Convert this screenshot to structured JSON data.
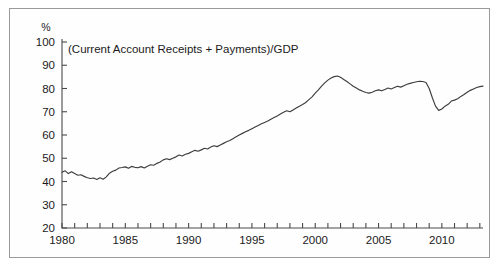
{
  "chart_data": {
    "type": "line",
    "title": "(Current Account Receipts + Payments)/GDP",
    "unit_label": "%",
    "xlabel": "",
    "ylabel": "",
    "grid": false,
    "legend": null,
    "xlim": [
      1980,
      2013.25
    ],
    "ylim": [
      20,
      100
    ],
    "ytick_values": [
      20,
      30,
      40,
      50,
      60,
      70,
      80,
      90,
      100
    ],
    "ytick_labels": [
      "20",
      "30",
      "40",
      "50",
      "60",
      "70",
      "80",
      "90",
      "100"
    ],
    "xtick_values": [
      1980,
      1981,
      1982,
      1983,
      1984,
      1985,
      1986,
      1987,
      1988,
      1989,
      1990,
      1991,
      1992,
      1993,
      1994,
      1995,
      1996,
      1997,
      1998,
      1999,
      2000,
      2001,
      2002,
      2003,
      2004,
      2005,
      2006,
      2007,
      2008,
      2009,
      2010,
      2011,
      2012,
      2013
    ],
    "xtick_labels_major": [
      "1980",
      "1985",
      "1990",
      "1995",
      "2000",
      "2005",
      "2010"
    ],
    "xtick_values_major": [
      1980,
      1985,
      1990,
      1995,
      2000,
      2005,
      2010
    ],
    "series": [
      {
        "name": "(Current Account Receipts + Payments)/GDP",
        "color": "#3d3d3d",
        "x": [
          1980.0,
          1980.25,
          1980.5,
          1980.75,
          1981.0,
          1981.25,
          1981.5,
          1981.75,
          1982.0,
          1982.25,
          1982.5,
          1982.75,
          1983.0,
          1983.25,
          1983.5,
          1983.75,
          1984.0,
          1984.25,
          1984.5,
          1984.75,
          1985.0,
          1985.25,
          1985.5,
          1985.75,
          1986.0,
          1986.25,
          1986.5,
          1986.75,
          1987.0,
          1987.25,
          1987.5,
          1987.75,
          1988.0,
          1988.25,
          1988.5,
          1988.75,
          1989.0,
          1989.25,
          1989.5,
          1989.75,
          1990.0,
          1990.25,
          1990.5,
          1990.75,
          1991.0,
          1991.25,
          1991.5,
          1991.75,
          1992.0,
          1992.25,
          1992.5,
          1992.75,
          1993.0,
          1993.25,
          1993.5,
          1993.75,
          1994.0,
          1994.25,
          1994.5,
          1994.75,
          1995.0,
          1995.25,
          1995.5,
          1995.75,
          1996.0,
          1996.25,
          1996.5,
          1996.75,
          1997.0,
          1997.25,
          1997.5,
          1997.75,
          1998.0,
          1998.25,
          1998.5,
          1998.75,
          1999.0,
          1999.25,
          1999.5,
          1999.75,
          2000.0,
          2000.25,
          2000.5,
          2000.75,
          2001.0,
          2001.25,
          2001.5,
          2001.75,
          2002.0,
          2002.25,
          2002.5,
          2002.75,
          2003.0,
          2003.25,
          2003.5,
          2003.75,
          2004.0,
          2004.25,
          2004.5,
          2004.75,
          2005.0,
          2005.25,
          2005.5,
          2005.75,
          2006.0,
          2006.25,
          2006.5,
          2006.75,
          2007.0,
          2007.25,
          2007.5,
          2007.75,
          2008.0,
          2008.25,
          2008.5,
          2008.75,
          2009.0,
          2009.25,
          2009.5,
          2009.75,
          2010.0,
          2010.25,
          2010.5,
          2010.75,
          2011.0,
          2011.25,
          2011.5,
          2011.75,
          2012.0,
          2012.25,
          2012.5,
          2012.75,
          2013.0,
          2013.25
        ],
        "y": [
          44.0,
          44.6,
          43.4,
          44.2,
          43.4,
          42.7,
          42.9,
          42.2,
          41.6,
          41.3,
          41.5,
          40.9,
          41.6,
          41.0,
          42.0,
          43.6,
          44.4,
          44.9,
          45.8,
          46.0,
          46.3,
          45.7,
          46.5,
          46.1,
          45.9,
          46.4,
          45.8,
          46.6,
          47.2,
          47.0,
          47.8,
          48.4,
          49.3,
          49.8,
          49.4,
          50.0,
          50.6,
          51.4,
          51.0,
          51.7,
          52.1,
          52.8,
          53.4,
          53.0,
          53.6,
          54.3,
          54.0,
          54.8,
          55.4,
          55.0,
          55.7,
          56.4,
          57.1,
          57.6,
          58.4,
          59.2,
          60.0,
          60.7,
          61.4,
          62.0,
          62.7,
          63.4,
          64.1,
          64.8,
          65.4,
          66.0,
          66.8,
          67.5,
          68.2,
          69.0,
          69.8,
          70.4,
          70.0,
          70.8,
          71.6,
          72.4,
          73.1,
          74.0,
          75.2,
          76.4,
          78.0,
          79.4,
          81.0,
          82.4,
          83.6,
          84.5,
          85.1,
          85.4,
          84.8,
          83.9,
          83.0,
          82.0,
          81.0,
          80.2,
          79.4,
          78.8,
          78.3,
          78.0,
          78.4,
          79.0,
          79.4,
          79.0,
          79.6,
          80.2,
          79.8,
          80.4,
          81.0,
          80.6,
          81.2,
          81.8,
          82.2,
          82.6,
          82.9,
          83.1,
          83.0,
          82.6,
          80.0,
          76.0,
          72.4,
          70.6,
          71.2,
          72.4,
          73.2,
          74.6,
          75.0,
          75.6,
          76.6,
          77.4,
          78.4,
          79.2,
          79.8,
          80.4,
          80.8,
          81.0
        ]
      }
    ]
  }
}
